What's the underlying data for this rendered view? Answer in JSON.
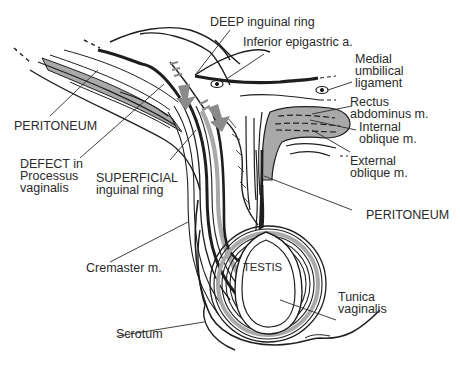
{
  "diagram": {
    "colors": {
      "line": "#1e1e1e",
      "muscle_fill": "#a9a9a9",
      "arrow_fill": "#8a8a8a",
      "label": "#2a2a2a",
      "background": "#ffffff"
    },
    "labels": {
      "deep_ring": "DEEP inguinal ring",
      "inferior_epigastric": "Inferior epigastric a.",
      "medial_umbilical": "Medial\numbilical\nligament",
      "rectus": "Rectus\nabdominus m.",
      "internal_oblique": "Internal\noblique m.",
      "external_oblique": "External\noblique m.",
      "peritoneum_left": "PERITONEUM",
      "defect": "DEFECT in\nProcessus\nvaginalis",
      "superficial_ring": "SUPERFICIAL\ninguinal ring",
      "peritoneum_right": "PERITONEUM",
      "cremaster": "Cremaster m.",
      "testis": "TESTIS",
      "tunica": "Tunica\nvaginalis",
      "scrotum": "Scrotum"
    }
  }
}
